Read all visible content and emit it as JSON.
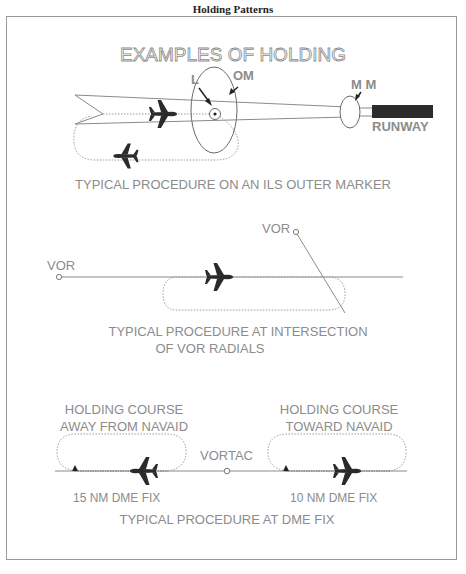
{
  "page_title": "Holding Patterns",
  "diagram": {
    "heading": "EXAMPLES OF HOLDING",
    "section_ils": {
      "label_l": "L",
      "label_om": "OM",
      "label_mm": "M M",
      "label_runway": "RUNWAY",
      "caption": "TYPICAL PROCEDURE ON AN ILS OUTER MARKER"
    },
    "section_vor": {
      "label_vor_left": "VOR",
      "label_vor_right": "VOR",
      "caption_line1": "TYPICAL PROCEDURE AT INTERSECTION",
      "caption_line2": "OF VOR RADIALS"
    },
    "section_dme": {
      "left_title_line1": "HOLDING COURSE",
      "left_title_line2": "AWAY FROM NAVAID",
      "right_title_line1": "HOLDING COURSE",
      "right_title_line2": "TOWARD NAVAID",
      "label_vortac": "VORTAC",
      "label_left_fix": "15 NM DME FIX",
      "label_right_fix": "10 NM DME FIX",
      "caption": "TYPICAL PROCEDURE AT DME FIX"
    }
  },
  "colors": {
    "line": "#8a8a8a",
    "label": "#8c8c8c",
    "aircraft": "#2a2a2a",
    "runway": "#2b2b2b"
  }
}
